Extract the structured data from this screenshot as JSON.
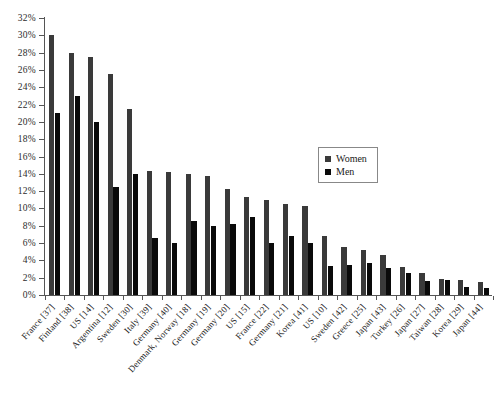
{
  "chart_data": {
    "type": "bar",
    "title": "",
    "subtitle": "",
    "xlabel": "",
    "ylabel": "",
    "ylim": [
      0,
      32
    ],
    "ytick_labels": [
      "0%",
      "2%",
      "4%",
      "6%",
      "8%",
      "10%",
      "12%",
      "14%",
      "16%",
      "18%",
      "20%",
      "22%",
      "24%",
      "26%",
      "28%",
      "30%",
      "32%"
    ],
    "ytick_values": [
      0,
      2,
      4,
      6,
      8,
      10,
      12,
      14,
      16,
      18,
      20,
      22,
      24,
      26,
      28,
      30,
      32
    ],
    "grid": false,
    "legend_position": "center-right",
    "categories": [
      "France [37]",
      "Finland [38]",
      "US [14]",
      "Argentina [12]",
      "Sweden [30]",
      "Italy [39]",
      "Germany [40]",
      "Denmark, Norway [18]",
      "Germany [19]",
      "Germany [20]",
      "US [15]",
      "France [22]",
      "Germany [21]",
      "Korea [41]",
      "US [10]",
      "Sweden [42]",
      "Greece [25]",
      "Japan [43]",
      "Turkey [26]",
      "Japan [27]",
      "Taiwan [28]",
      "Korea [29]",
      "Japan [44]"
    ],
    "series": [
      {
        "name": "Women",
        "color": "#3a3a3a",
        "values": [
          30.0,
          28.0,
          27.5,
          25.5,
          21.5,
          14.3,
          14.2,
          14.0,
          13.8,
          12.2,
          11.3,
          11.0,
          10.5,
          10.3,
          6.8,
          5.6,
          5.2,
          4.6,
          3.2,
          2.6,
          1.8,
          1.7,
          1.5
        ]
      },
      {
        "name": "Men",
        "color": "#0a0a0a",
        "values": [
          21.0,
          23.0,
          20.0,
          12.5,
          14.0,
          6.6,
          6.0,
          8.5,
          8.0,
          8.2,
          9.0,
          6.0,
          6.8,
          6.0,
          3.3,
          3.5,
          3.7,
          3.1,
          2.6,
          1.6,
          1.7,
          0.9,
          0.8
        ]
      }
    ]
  },
  "legend": {
    "entries": [
      {
        "label": "Women",
        "swatch": "women"
      },
      {
        "label": "Men",
        "swatch": "men"
      }
    ]
  }
}
